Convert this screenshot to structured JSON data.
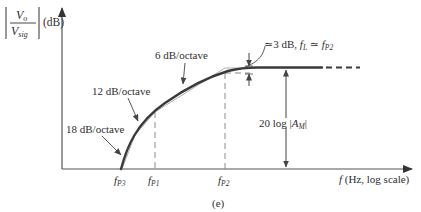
{
  "figure": {
    "caption": "(e)",
    "y_axis": {
      "label_numerator": "V",
      "label_numerator_sub": "o",
      "label_denominator": "V",
      "label_denominator_sub": "sig",
      "unit": "(dB)"
    },
    "x_axis": {
      "label_f": "f",
      "label_rest": "(Hz, log scale)"
    },
    "ticks": [
      {
        "main": "f",
        "sub": "P3"
      },
      {
        "main": "f",
        "sub": "P1"
      },
      {
        "main": "f",
        "sub": "P2"
      }
    ],
    "annotations": {
      "slope_18": "18 dB/octave",
      "slope_12": "12 dB/octave",
      "slope_6": "6 dB/octave",
      "three_db_prefix": "≃3 dB, ",
      "three_db_fl": "f",
      "three_db_fl_sub": "L",
      "three_db_eq": " ≃ ",
      "three_db_fp": "f",
      "three_db_fp_sub": "P2",
      "midband_prefix": "20 log |",
      "midband_A": "A",
      "midband_sub": "M",
      "midband_suffix": "|"
    },
    "colors": {
      "curve": "#3a3a3a",
      "axis": "#555555",
      "dashed": "#8a8a8a"
    }
  }
}
